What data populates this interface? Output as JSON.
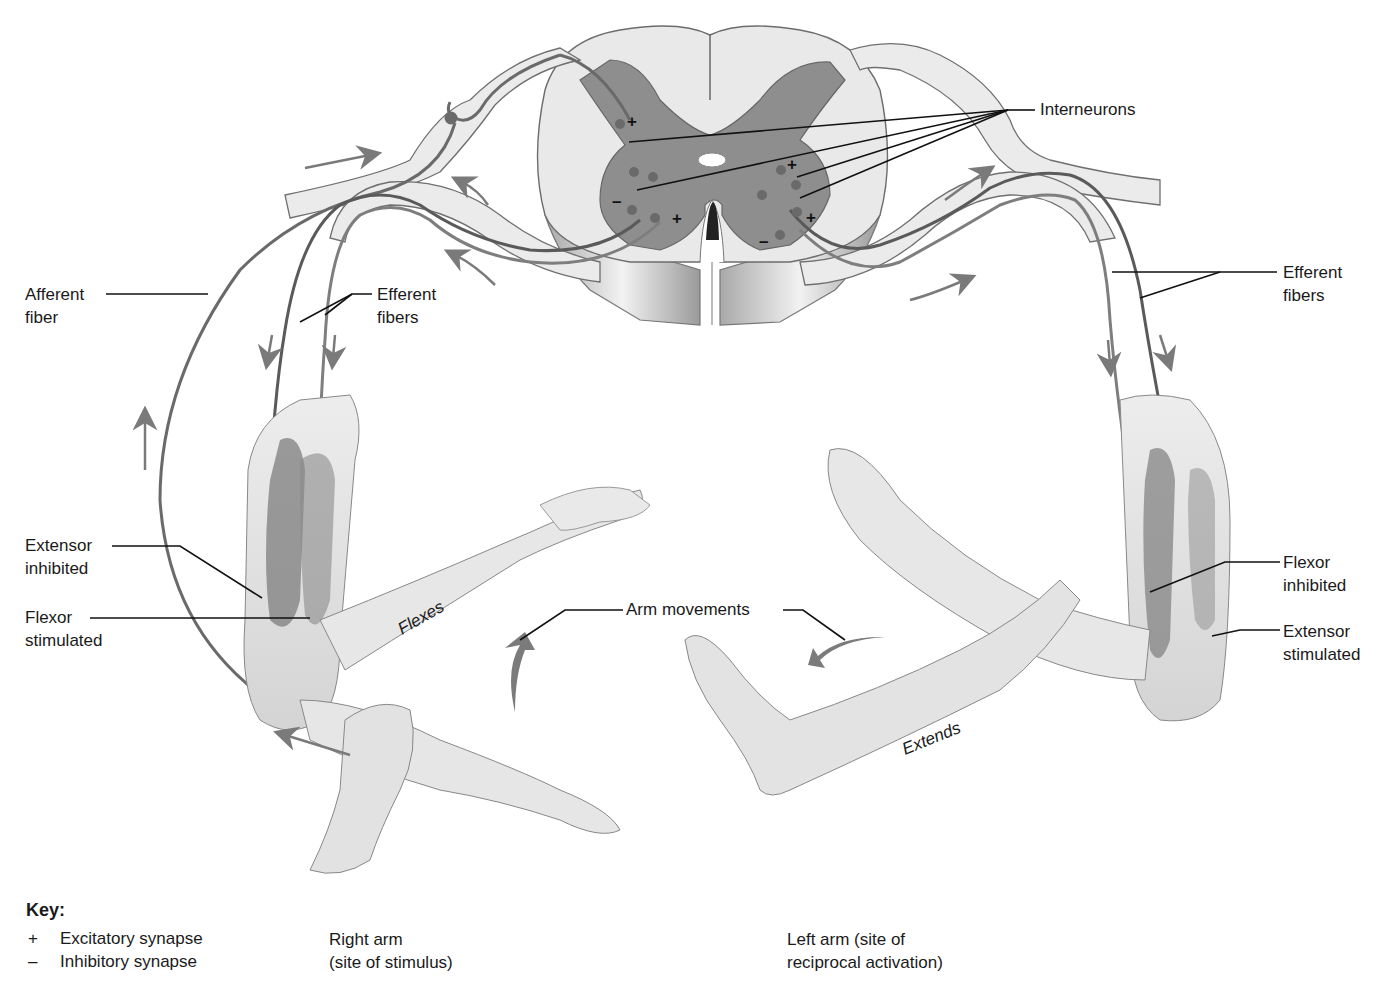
{
  "diagram": {
    "colors": {
      "background": "#ffffff",
      "white_matter": "#e8e8e8",
      "gray_matter": "#8c8c8c",
      "nerve_fill": "#ebebeb",
      "fiber": "#6e6e6e",
      "skin": "#e4e4e4",
      "muscle": "#8a8a8a",
      "arrow": "#7a7a7a",
      "label_line": "#111111"
    },
    "labels": {
      "interneurons": "Interneurons",
      "afferent_fiber": [
        "Afferent",
        "fiber"
      ],
      "efferent_fibers_left": [
        "Efferent",
        "fibers"
      ],
      "efferent_fibers_right": [
        "Efferent",
        "fibers"
      ],
      "extensor_inhibited": [
        "Extensor",
        "inhibited"
      ],
      "flexor_stimulated": [
        "Flexor",
        "stimulated"
      ],
      "flexor_inhibited": [
        "Flexor",
        "inhibited"
      ],
      "extensor_stimulated": [
        "Extensor",
        "stimulated"
      ],
      "arm_movements": "Arm movements",
      "flexes": "Flexes",
      "extends": "Extends"
    },
    "synapse_signs": {
      "excitatory": "+",
      "inhibitory": "–"
    },
    "key": {
      "title": "Key:",
      "items": [
        {
          "symbol": "+",
          "text": "Excitatory synapse"
        },
        {
          "symbol": "–",
          "text": "Inhibitory synapse"
        }
      ]
    },
    "captions": {
      "right_arm": [
        "Right arm",
        "(site of stimulus)"
      ],
      "left_arm": [
        "Left arm (site of",
        "reciprocal activation)"
      ]
    }
  }
}
